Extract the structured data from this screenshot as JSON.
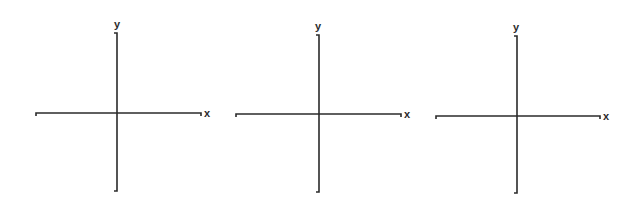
{
  "diagram": {
    "axes": [
      {
        "id": "axes-1",
        "x_label": "x",
        "y_label": "y",
        "h_line": {
          "x1": 36,
          "x2": 201,
          "y": 113
        },
        "v_line": {
          "x": 117,
          "y1": 33,
          "y2": 191
        },
        "x_label_pos": {
          "x": 204,
          "y": 117
        },
        "y_label_pos": {
          "x": 114,
          "y": 28
        }
      },
      {
        "id": "axes-2",
        "x_label": "x",
        "y_label": "y",
        "h_line": {
          "x1": 236,
          "x2": 401,
          "y": 114
        },
        "v_line": {
          "x": 319,
          "y1": 35,
          "y2": 192
        },
        "x_label_pos": {
          "x": 404,
          "y": 118
        },
        "y_label_pos": {
          "x": 315,
          "y": 30
        }
      },
      {
        "id": "axes-3",
        "x_label": "x",
        "y_label": "y",
        "h_line": {
          "x1": 436,
          "x2": 600,
          "y": 116
        },
        "v_line": {
          "x": 517,
          "y1": 36,
          "y2": 193
        },
        "x_label_pos": {
          "x": 603,
          "y": 120
        },
        "y_label_pos": {
          "x": 513,
          "y": 31
        }
      }
    ]
  }
}
